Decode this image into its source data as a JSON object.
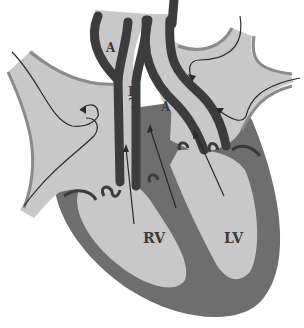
{
  "diagram": {
    "labels": {
      "aorta_upper": "A",
      "pulmonary_trunk_p": "P",
      "pulmonary_trunk_t": "T",
      "aorta_lower": "A",
      "right_ventricle": "RV",
      "left_ventricle": "LV"
    },
    "colors": {
      "background": "#ffffff",
      "chamber_fill": "#c8c8c8",
      "myocardium": "#6e6e6e",
      "vessel_wall": "#3c3c3c",
      "atrium_wall": "#8a8a8a",
      "arrow": "#2a2a2a"
    }
  }
}
